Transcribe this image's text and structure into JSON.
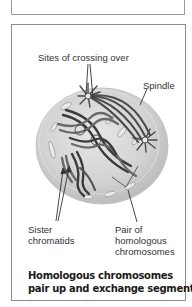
{
  "figure": {
    "labels": {
      "crossing_over": "Sites of crossing over",
      "spindle": "Spindle",
      "sister_chromatids_line1": "Sister",
      "sister_chromatids_line2": "chromatids",
      "homologous_line1": "Pair of",
      "homologous_line2": "homologous",
      "homologous_line3": "chromosomes"
    },
    "caption": {
      "line1": "Homologous chromosomes",
      "line2": "pair up and exchange segments."
    },
    "colors": {
      "cell_fill": "#d4d4d4",
      "cell_edge": "#bdbdbd",
      "chromosome_dark": "#3a3a3a",
      "chromosome_mid": "#6a6a6a",
      "border": "#8c8c8c"
    }
  }
}
